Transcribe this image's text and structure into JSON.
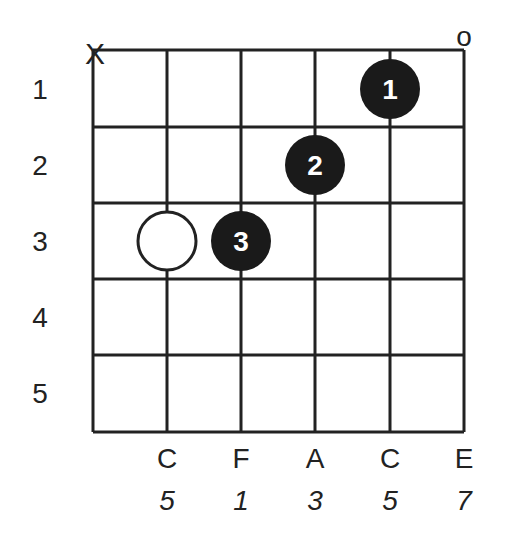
{
  "diagram": {
    "type": "chord-chart",
    "fret_labels": [
      "1",
      "2",
      "3",
      "4",
      "5"
    ],
    "string_markers": [
      {
        "string": 0,
        "symbol": "X"
      },
      {
        "string": 5,
        "symbol": "o"
      }
    ],
    "notes": [
      "C",
      "F",
      "A",
      "C",
      "E"
    ],
    "intervals": [
      "5",
      "1",
      "3",
      "5",
      "7"
    ],
    "fingers": [
      {
        "string": 4,
        "fret": 1,
        "label": "1",
        "style": "filled"
      },
      {
        "string": 3,
        "fret": 2,
        "label": "2",
        "style": "filled"
      },
      {
        "string": 2,
        "fret": 3,
        "label": "3",
        "style": "filled"
      },
      {
        "string": 1,
        "fret": 3,
        "label": "",
        "style": "open"
      }
    ]
  }
}
